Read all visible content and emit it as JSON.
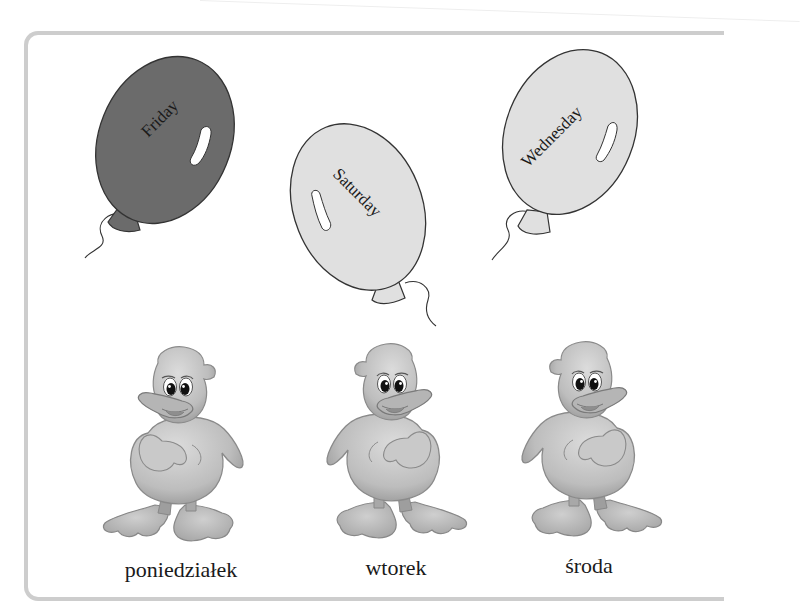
{
  "balloons": [
    {
      "label": "Friday",
      "fill": "#6b6b6b"
    },
    {
      "label": "Saturday",
      "fill": "#e0e0e0"
    },
    {
      "label": "Wednesday",
      "fill": "#e0e0e0"
    }
  ],
  "ducks": [
    {
      "label": "poniedziałek"
    },
    {
      "label": "wtorek"
    },
    {
      "label": "środa"
    }
  ],
  "colors": {
    "frame_border": "#cdcdcd",
    "balloon_dark": "#6b6b6b",
    "balloon_light": "#e0e0e0",
    "duck_fill": "#c4c4c4",
    "text": "#1a1a1a"
  }
}
